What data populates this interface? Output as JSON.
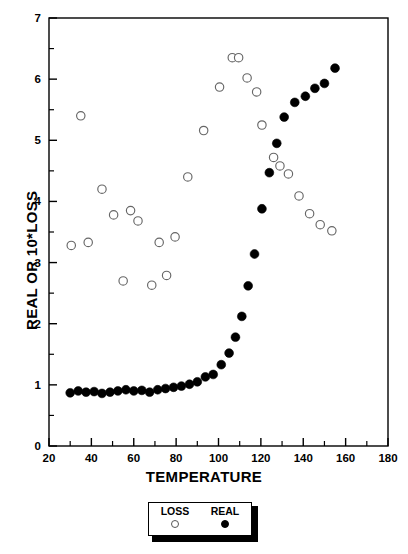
{
  "chart_data": {
    "type": "scatter",
    "title": "",
    "xlabel": "TEMPERATURE",
    "ylabel": "REAL OR 10*LOSS",
    "xlim": [
      20,
      180
    ],
    "ylim": [
      0,
      7
    ],
    "xticks": [
      20,
      40,
      60,
      80,
      100,
      120,
      140,
      160,
      180
    ],
    "yticks": [
      0,
      1,
      2,
      3,
      4,
      5,
      6,
      7
    ],
    "x_minor_tick_step": 10,
    "y_minor_tick_step": 0.5,
    "grid": false,
    "legend_position": "below-axes-center",
    "frame": true,
    "series": [
      {
        "name": "LOSS",
        "marker": "open-circle",
        "color": "#666666",
        "points": [
          [
            30.5,
            3.28
          ],
          [
            35.0,
            5.4
          ],
          [
            38.5,
            3.33
          ],
          [
            45.0,
            4.2
          ],
          [
            50.5,
            3.78
          ],
          [
            55.0,
            2.7
          ],
          [
            58.5,
            3.85
          ],
          [
            62.0,
            3.68
          ],
          [
            68.5,
            2.63
          ],
          [
            72.0,
            3.33
          ],
          [
            75.5,
            2.79
          ],
          [
            79.5,
            3.42
          ],
          [
            85.5,
            4.4
          ],
          [
            93.0,
            5.16
          ],
          [
            100.5,
            5.87
          ],
          [
            106.5,
            6.35
          ],
          [
            109.5,
            6.35
          ],
          [
            113.5,
            6.02
          ],
          [
            118.0,
            5.79
          ],
          [
            120.5,
            5.25
          ],
          [
            126.0,
            4.72
          ],
          [
            129.0,
            4.58
          ],
          [
            133.0,
            4.45
          ],
          [
            138.0,
            4.09
          ],
          [
            143.0,
            3.8
          ],
          [
            148.0,
            3.62
          ],
          [
            153.5,
            3.52
          ]
        ]
      },
      {
        "name": "REAL",
        "marker": "filled-circle",
        "color": "#000000",
        "points": [
          [
            30.0,
            0.87
          ],
          [
            33.8,
            0.9
          ],
          [
            37.5,
            0.88
          ],
          [
            41.3,
            0.89
          ],
          [
            45.0,
            0.86
          ],
          [
            48.8,
            0.88
          ],
          [
            52.5,
            0.9
          ],
          [
            56.3,
            0.92
          ],
          [
            60.0,
            0.9
          ],
          [
            63.8,
            0.91
          ],
          [
            67.5,
            0.88
          ],
          [
            71.3,
            0.92
          ],
          [
            75.0,
            0.94
          ],
          [
            78.8,
            0.96
          ],
          [
            82.5,
            0.98
          ],
          [
            86.3,
            1.01
          ],
          [
            90.0,
            1.05
          ],
          [
            93.8,
            1.13
          ],
          [
            97.5,
            1.17
          ],
          [
            101.3,
            1.33
          ],
          [
            105.0,
            1.52
          ],
          [
            108.0,
            1.78
          ],
          [
            111.0,
            2.12
          ],
          [
            114.0,
            2.62
          ],
          [
            117.0,
            3.14
          ],
          [
            120.5,
            3.88
          ],
          [
            124.0,
            4.47
          ],
          [
            127.5,
            4.95
          ],
          [
            131.0,
            5.38
          ],
          [
            136.0,
            5.62
          ],
          [
            141.0,
            5.72
          ],
          [
            145.5,
            5.85
          ],
          [
            150.0,
            5.93
          ],
          [
            155.0,
            6.18
          ]
        ]
      }
    ]
  },
  "legend": {
    "entries": [
      {
        "label": "LOSS",
        "marker": "open-circle"
      },
      {
        "label": "REAL",
        "marker": "filled-circle"
      }
    ]
  }
}
